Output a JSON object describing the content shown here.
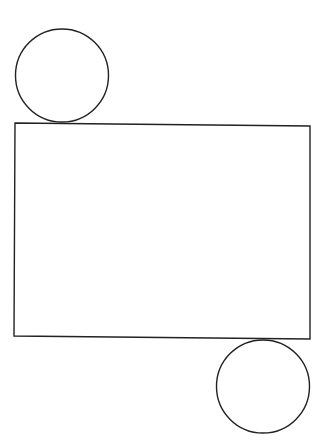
{
  "diagram": {
    "stroke_color": "#222222",
    "background": "#ffffff",
    "shapes": {
      "top_circle": {
        "cx": 62,
        "cy": 75.5,
        "r": 46.5
      },
      "rectangle": {
        "points": "15,123 310,126 310,339 14,336"
      },
      "bottom_circle": {
        "cx": 263,
        "cy": 386.5,
        "r": 46.5
      }
    }
  }
}
